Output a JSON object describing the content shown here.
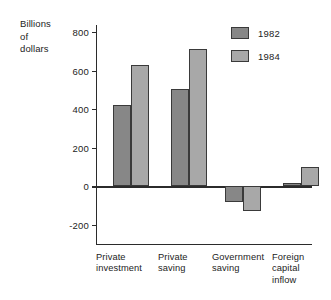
{
  "axis_unit_label": "Billions\nof\ndollars",
  "legend": {
    "position": "top-right",
    "entries": [
      {
        "label": "1982",
        "color": "#878787"
      },
      {
        "label": "1984",
        "color": "#a8a8a8"
      }
    ]
  },
  "chart_data": {
    "type": "bar",
    "title": "",
    "xlabel": "",
    "ylabel": "Billions of dollars",
    "categories": [
      "Private\ninvestment",
      "Private\nsaving",
      "Government\nsaving",
      "Foreign\ncapital\ninflow"
    ],
    "series": [
      {
        "name": "1982",
        "color": "#878787",
        "values": [
          420,
          505,
          -80,
          20
        ]
      },
      {
        "name": "1984",
        "color": "#a8a8a8",
        "values": [
          630,
          710,
          -125,
          100
        ]
      }
    ],
    "ylim": [
      -200,
      800
    ],
    "ytick_values": [
      800,
      600,
      400,
      200,
      0,
      -200
    ],
    "ytick_labels": [
      "800",
      "600",
      "400",
      "200",
      "0",
      "-200"
    ],
    "grid": false,
    "zero_line": true
  }
}
